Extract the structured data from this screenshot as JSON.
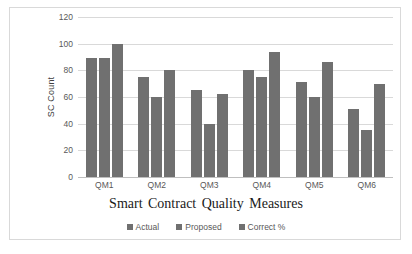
{
  "chart_data": {
    "type": "bar",
    "title": "",
    "xlabel": "Smart Contract Quality Measures",
    "ylabel": "SC Count",
    "categories": [
      "QM1",
      "QM2",
      "QM3",
      "QM4",
      "QM5",
      "QM6"
    ],
    "series": [
      {
        "name": "Actual",
        "values": [
          89,
          75,
          65,
          80,
          71,
          51
        ],
        "color": "#707070"
      },
      {
        "name": "Proposed",
        "values": [
          89,
          60,
          40,
          75,
          60,
          35
        ],
        "color": "#707070"
      },
      {
        "name": "Correct %",
        "values": [
          100,
          80,
          62,
          94,
          86,
          70
        ],
        "color": "#707070"
      }
    ],
    "ylim": [
      0,
      120
    ],
    "yticks": [
      0,
      20,
      40,
      60,
      80,
      100,
      120
    ],
    "ytick_labels": [
      "0",
      "20",
      "40",
      "60",
      "80",
      "100",
      "120"
    ],
    "grid": true,
    "grid_axis": "y",
    "legend_position": "bottom",
    "bar_color": "#707070",
    "gridline_color": "#d9d9d9",
    "frame_color": "#d9d9d9"
  }
}
